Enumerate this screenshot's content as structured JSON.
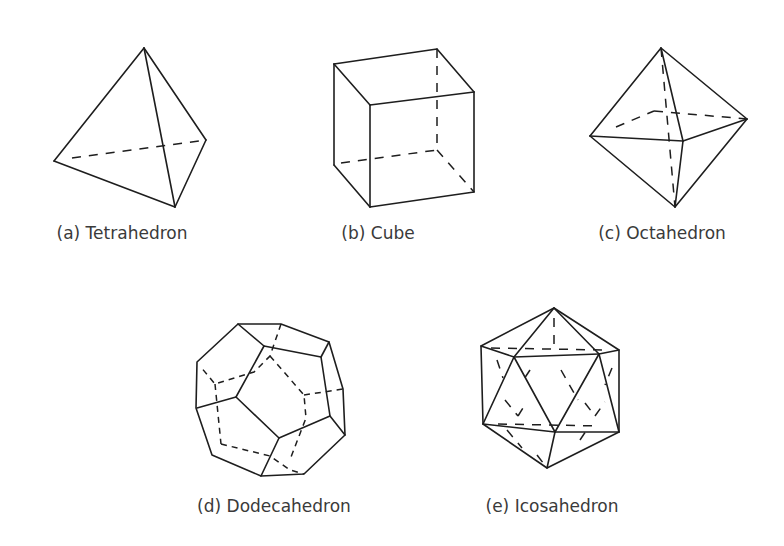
{
  "figure": {
    "panels": [
      {
        "id": "a",
        "label": "(a) Tetrahedron",
        "shape": "tetrahedron-icon"
      },
      {
        "id": "b",
        "label": "(b) Cube",
        "shape": "cube-icon"
      },
      {
        "id": "c",
        "label": "(c) Octahedron",
        "shape": "octahedron-icon"
      },
      {
        "id": "d",
        "label": "(d) Dodecahedron",
        "shape": "dodecahedron-icon"
      },
      {
        "id": "e",
        "label": "(e) Icosahedron",
        "shape": "icosahedron-icon"
      }
    ],
    "line_color": "#1e1e1e",
    "caption_color": "#3a3a3a",
    "background": "#ffffff"
  }
}
